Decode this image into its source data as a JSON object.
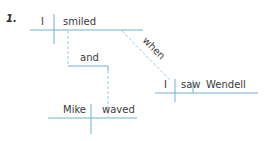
{
  "item_number": "1.",
  "colors": {
    "line": "#6fb1d4",
    "dashed": "#9fc9df",
    "text": "#3a3a3a"
  },
  "diagram": {
    "clause1": {
      "subject": "I",
      "verb": "smiled"
    },
    "conjunction": "and",
    "clause2": {
      "subject": "Mike",
      "verb": "waved"
    },
    "subordinator": "when",
    "clause3": {
      "subject": "I",
      "verb": "saw",
      "object": "Wendell"
    }
  }
}
